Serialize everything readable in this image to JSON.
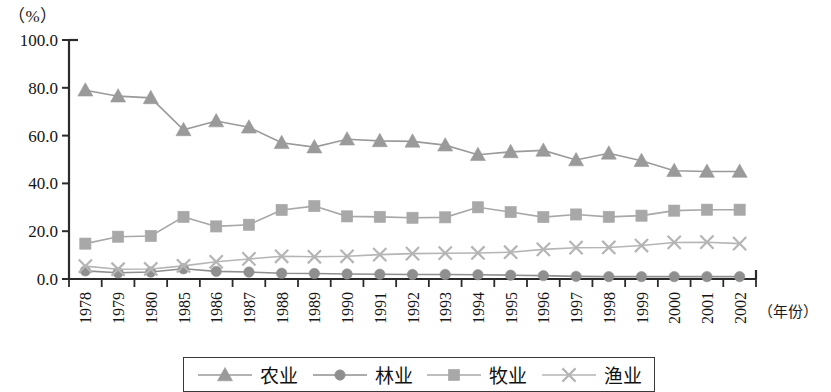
{
  "chart_data": {
    "type": "line",
    "title": "",
    "subtitle": "",
    "unit_label": "（%）",
    "xlabel": "（年份）",
    "ylabel": "",
    "ylim": [
      0,
      100
    ],
    "ytick_values": [
      0.0,
      20.0,
      40.0,
      60.0,
      80.0,
      100.0
    ],
    "ytick_labels": [
      "0.0",
      "20.0",
      "40.0",
      "60.0",
      "80.0",
      "100.0"
    ],
    "grid": false,
    "legend_position": "bottom",
    "categories": [
      "1978",
      "1979",
      "1980",
      "1985",
      "1986",
      "1987",
      "1988",
      "1989",
      "1990",
      "1991",
      "1992",
      "1993",
      "1994",
      "1995",
      "1996",
      "1997",
      "1998",
      "1999",
      "2000",
      "2001",
      "2002"
    ],
    "series": [
      {
        "name": "农业",
        "marker": "triangle",
        "color": "#9a9a9a",
        "values": [
          79.0,
          76.5,
          75.8,
          62.4,
          66.1,
          63.5,
          57.0,
          55.2,
          58.5,
          57.8,
          57.6,
          56.0,
          52.0,
          53.2,
          53.8,
          49.8,
          52.6,
          49.5,
          45.3,
          45.0,
          45.0
        ]
      },
      {
        "name": "林业",
        "marker": "circle",
        "color": "#8f8f8f",
        "values": [
          3.4,
          2.6,
          2.9,
          4.3,
          3.2,
          2.9,
          2.4,
          2.3,
          2.1,
          2.0,
          1.9,
          1.9,
          1.8,
          1.6,
          1.4,
          1.1,
          1.0,
          1.0,
          1.0,
          1.0,
          1.0
        ]
      },
      {
        "name": "牧业",
        "marker": "square",
        "color": "#a8a8a8",
        "values": [
          14.8,
          17.7,
          18.0,
          26.0,
          22.0,
          22.7,
          28.9,
          30.5,
          26.2,
          26.0,
          25.6,
          25.8,
          30.0,
          28.0,
          25.9,
          27.0,
          26.0,
          26.5,
          28.6,
          29.0,
          29.0
        ]
      },
      {
        "name": "渔业",
        "marker": "cross",
        "color": "#b5b5b5",
        "values": [
          5.4,
          4.1,
          4.2,
          5.5,
          7.2,
          8.4,
          9.5,
          9.3,
          9.5,
          10.2,
          10.6,
          10.8,
          10.9,
          11.2,
          12.4,
          13.1,
          13.2,
          14.0,
          15.3,
          15.4,
          14.8
        ]
      }
    ]
  },
  "legend": {
    "items": [
      {
        "label": "农业",
        "marker": "triangle",
        "color": "#9a9a9a"
      },
      {
        "label": "林业",
        "marker": "circle",
        "color": "#8f8f8f"
      },
      {
        "label": "牧业",
        "marker": "square",
        "color": "#a8a8a8"
      },
      {
        "label": "渔业",
        "marker": "cross",
        "color": "#b5b5b5"
      }
    ]
  },
  "axis": {
    "color": "#2b2b2b"
  }
}
